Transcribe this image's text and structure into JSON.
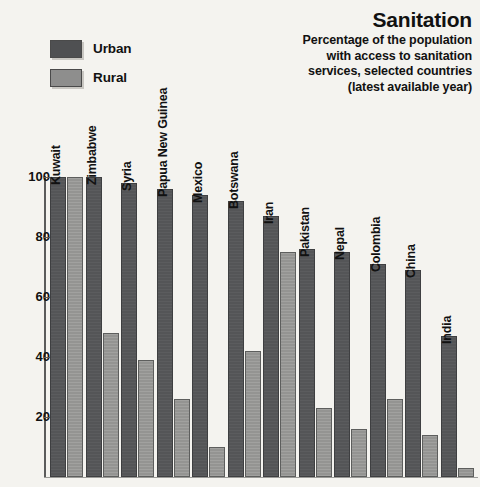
{
  "title": "Sanitation",
  "subtitle": "Percentage of the population\nwith access to sanitation\nservices, selected countries\n(latest available year)",
  "legend": {
    "items": [
      {
        "label": "Urban",
        "color": "#545557",
        "key": "urban"
      },
      {
        "label": "Rural",
        "color": "#949492",
        "key": "rural"
      }
    ]
  },
  "axis": {
    "ticks": [
      "100",
      "80",
      "60",
      "40",
      "20"
    ]
  },
  "chart_data": {
    "type": "bar",
    "title": "Sanitation",
    "subtitle": "Percentage of the population with access to sanitation services, selected countries (latest available year)",
    "xlabel": "",
    "ylabel": "",
    "ylim": [
      0,
      100
    ],
    "ytick_values": [
      20,
      40,
      60,
      80,
      100
    ],
    "grid": false,
    "legend_position": "top-left",
    "categories": [
      "Kuwait",
      "Zimbabwe",
      "Syria",
      "Papua New Guinea",
      "Mexico",
      "Botswana",
      "Iran",
      "Pakistan",
      "Nepal",
      "Colombia",
      "China",
      "India"
    ],
    "series": [
      {
        "name": "Urban",
        "color": "#545557",
        "values": [
          100,
          100,
          98,
          96,
          94,
          92,
          87,
          76,
          75,
          71,
          69,
          47
        ]
      },
      {
        "name": "Rural",
        "color": "#949492",
        "values": [
          100,
          48,
          39,
          26,
          10,
          42,
          75,
          23,
          16,
          26,
          14,
          3
        ]
      }
    ]
  }
}
